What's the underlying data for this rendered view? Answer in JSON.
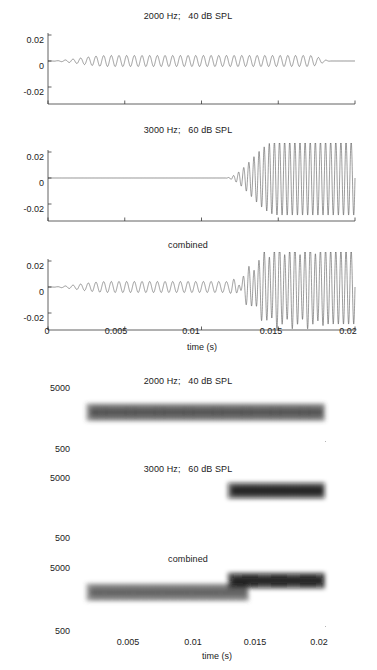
{
  "figure": {
    "background_color": "#ffffff",
    "line_color": "#4a4a4a",
    "axis_color": "#3a3a3a"
  },
  "waveform_section": {
    "xlabel": "time (s)",
    "x_ticks": [
      "0",
      "0.005",
      "0.01",
      "0.015",
      "0.02"
    ],
    "x_tick_values": [
      0,
      0.005,
      0.01,
      0.015,
      0.02
    ],
    "y_ticks": [
      "0.02",
      "0",
      "-0.02"
    ],
    "y_tick_values": [
      0.02,
      0,
      -0.02
    ],
    "panels": [
      {
        "title": "2000 Hz;   40 dB SPL",
        "frequency_hz": 2000,
        "level_db_spl": 40,
        "amplitude": 0.0042,
        "onset_s": 0.0,
        "ramp_s": 0.004,
        "offset_s": 0.0185,
        "offramp_s": 0.0015
      },
      {
        "title": "3000 Hz;   60 dB SPL",
        "frequency_hz": 3000,
        "level_db_spl": 60,
        "amplitude": 0.0285,
        "onset_s": 0.0115,
        "ramp_s": 0.0035,
        "offset_s": 0.02,
        "offramp_s": 0.0
      },
      {
        "title": "combined",
        "frequency_hz": null,
        "level_db_spl": null,
        "amplitude": null,
        "onset_s": 0.0,
        "ramp_s": 0.004,
        "offset_s": 0.02,
        "offramp_s": 0.0
      }
    ]
  },
  "spectrogram_section": {
    "xlabel": "time (s)",
    "x_ticks": [
      "0.005",
      "0.01",
      "0.015",
      "0.02"
    ],
    "x_tick_values": [
      0.005,
      0.01,
      0.015,
      0.02
    ],
    "y_ticks": [
      "5000",
      "500"
    ],
    "y_tick_values": [
      5000,
      500
    ],
    "panels": [
      {
        "title": "2000 Hz;   40 dB SPL",
        "bands": [
          {
            "frequency_hz": 2000,
            "t_start_s": 0.0005,
            "t_end_s": 0.0196,
            "darkness": 0.72,
            "thickness": 0.26
          }
        ]
      },
      {
        "title": "3000 Hz;   60 dB SPL",
        "bands": [
          {
            "frequency_hz": 3000,
            "t_start_s": 0.0118,
            "t_end_s": 0.0196,
            "darkness": 0.95,
            "thickness": 0.24
          }
        ]
      },
      {
        "title": "combined",
        "bands": [
          {
            "frequency_hz": 2000,
            "t_start_s": 0.0005,
            "t_end_s": 0.0135,
            "darkness": 0.66,
            "thickness": 0.26
          },
          {
            "frequency_hz": 3000,
            "t_start_s": 0.0118,
            "t_end_s": 0.0196,
            "darkness": 0.96,
            "thickness": 0.24
          }
        ]
      }
    ]
  },
  "chart_data": {
    "type": "line",
    "xlabel": "time (s)",
    "ylabel": "",
    "xlim": [
      0,
      0.02
    ],
    "ylim": [
      -0.032,
      0.032
    ],
    "grid": false,
    "legend": "none",
    "subplots": [
      {
        "index": 1,
        "kind": "waveform",
        "title": "2000 Hz;   40 dB SPL",
        "xlabel": "",
        "ylabel": "",
        "xlim": [
          0,
          0.02
        ],
        "ylim": [
          -0.032,
          0.032
        ],
        "xticks": [
          0,
          0.005,
          0.01,
          0.015,
          0.02
        ],
        "yticks": [
          -0.02,
          0,
          0.02
        ],
        "series": [
          {
            "name": "2000 Hz tone, 40 dB SPL",
            "frequency_hz": 2000,
            "peak_amplitude": 0.0042,
            "onset_s": 0.0,
            "rise_time_s": 0.004,
            "offset_s": 0.0185,
            "fall_time_s": 0.0015,
            "cycles_visible": 37
          }
        ]
      },
      {
        "index": 2,
        "kind": "waveform",
        "title": "3000 Hz;   60 dB SPL",
        "xlabel": "",
        "ylabel": "",
        "xlim": [
          0,
          0.02
        ],
        "ylim": [
          -0.032,
          0.032
        ],
        "xticks": [
          0,
          0.005,
          0.01,
          0.015,
          0.02
        ],
        "yticks": [
          -0.02,
          0,
          0.02
        ],
        "series": [
          {
            "name": "3000 Hz tone, 60 dB SPL",
            "frequency_hz": 3000,
            "peak_amplitude": 0.0285,
            "onset_s": 0.0115,
            "rise_time_s": 0.0035,
            "offset_s": 0.02,
            "fall_time_s": 0.0,
            "cycles_visible": 26
          }
        ]
      },
      {
        "index": 3,
        "kind": "waveform",
        "title": "combined",
        "xlabel": "time (s)",
        "ylabel": "",
        "xlim": [
          0,
          0.02
        ],
        "ylim": [
          -0.032,
          0.032
        ],
        "xticks": [
          0,
          0.005,
          0.01,
          0.015,
          0.02
        ],
        "yticks": [
          -0.02,
          0,
          0.02
        ],
        "series": [
          {
            "name": "sum of 2000 Hz and 3000 Hz tones",
            "components": [
              2000,
              3000
            ],
            "peak_amplitude": 0.0315
          }
        ]
      },
      {
        "index": 4,
        "kind": "spectrogram",
        "title": "2000 Hz;   40 dB SPL",
        "xlabel": "",
        "ylabel": "",
        "xlim": [
          0,
          0.02
        ],
        "ylim": [
          500,
          5000
        ],
        "xticks": [
          0.005,
          0.01,
          0.015,
          0.02
        ],
        "yticks": [
          500,
          5000
        ],
        "energy_bands": [
          {
            "center_hz": 2000,
            "t_start_s": 0.0005,
            "t_end_s": 0.0196,
            "intensity": 0.72
          }
        ]
      },
      {
        "index": 5,
        "kind": "spectrogram",
        "title": "3000 Hz;   60 dB SPL",
        "xlabel": "",
        "ylabel": "",
        "xlim": [
          0,
          0.02
        ],
        "ylim": [
          500,
          5000
        ],
        "xticks": [
          0.005,
          0.01,
          0.015,
          0.02
        ],
        "yticks": [
          500,
          5000
        ],
        "energy_bands": [
          {
            "center_hz": 3000,
            "t_start_s": 0.0118,
            "t_end_s": 0.0196,
            "intensity": 0.95
          }
        ]
      },
      {
        "index": 6,
        "kind": "spectrogram",
        "title": "combined",
        "xlabel": "time (s)",
        "ylabel": "",
        "xlim": [
          0,
          0.02
        ],
        "ylim": [
          500,
          5000
        ],
        "xticks": [
          0.005,
          0.01,
          0.015,
          0.02
        ],
        "yticks": [
          500,
          5000
        ],
        "energy_bands": [
          {
            "center_hz": 2000,
            "t_start_s": 0.0005,
            "t_end_s": 0.0135,
            "intensity": 0.66
          },
          {
            "center_hz": 3000,
            "t_start_s": 0.0118,
            "t_end_s": 0.0196,
            "intensity": 0.96
          }
        ]
      }
    ]
  }
}
